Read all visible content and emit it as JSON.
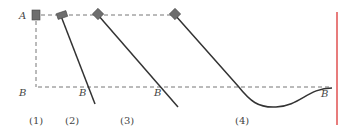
{
  "diagram": {
    "point_labels": {
      "A": "A",
      "B_left": "B",
      "B2": "B",
      "B3": "B",
      "B4": "B"
    },
    "case_labels": [
      "(1)",
      "(2)",
      "(3)",
      "(4)"
    ],
    "colors": {
      "line": "#333333",
      "dashed": "#777777",
      "block": "#6e6e6e",
      "marker": "#e05050",
      "text": "#444444"
    }
  }
}
